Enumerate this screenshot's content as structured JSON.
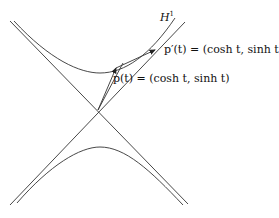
{
  "diagram": {
    "labels": {
      "hyperbola": "H",
      "hyperbola_sup": "1",
      "velocity": "p′(t) = (cosh t, sinh t)",
      "position": "p(t) = (cosh t, sinh t)"
    },
    "elements": [
      "asymptote lines",
      "upper hyperbola branch",
      "lower hyperbola branch",
      "position vector p(t)",
      "tangent vector p′(t)",
      "translated tangent vector"
    ]
  }
}
